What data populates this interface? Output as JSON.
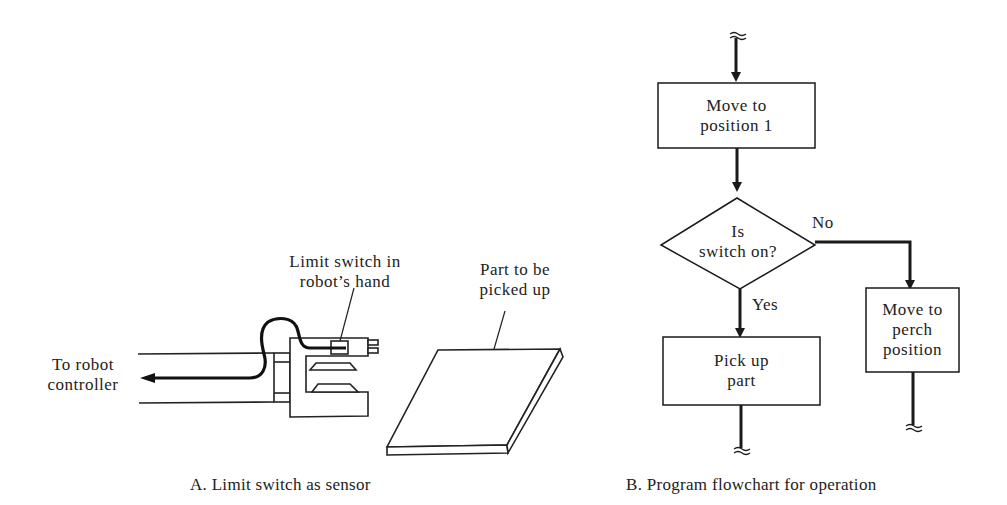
{
  "panel_a": {
    "labels": {
      "limit_switch_line1": "Limit switch in",
      "limit_switch_line2": "robot’s hand",
      "part_line1": "Part to be",
      "part_line2": "picked up",
      "controller_line1": "To robot",
      "controller_line2": "controller"
    },
    "caption": "A.  Limit switch as sensor"
  },
  "panel_b": {
    "nodes": {
      "move_pos1_line1": "Move to",
      "move_pos1_line2": "position 1",
      "decision_line1": "Is",
      "decision_line2": "switch on?",
      "pickup_line1": "Pick up",
      "pickup_line2": "part",
      "perch_line1": "Move to",
      "perch_line2": "perch",
      "perch_line3": "position"
    },
    "edges": {
      "no_label": "No",
      "yes_label": "Yes"
    },
    "caption": "B.  Program flowchart for operation"
  }
}
